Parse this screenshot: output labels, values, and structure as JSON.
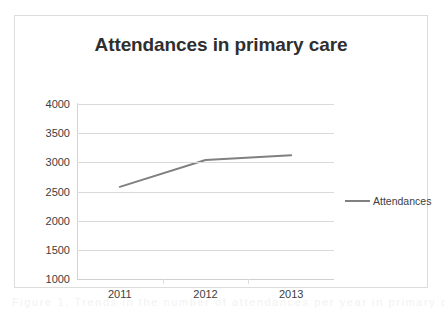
{
  "figure": {
    "background_color": "#ffffff",
    "frame_color": "#dcdcdc"
  },
  "caption": {
    "text": "Figure 1. Trends in the number of attendances per year in primary care"
  },
  "chart_data": {
    "type": "line",
    "title": "Attendances in primary care",
    "subtitle": "",
    "xlabel": "",
    "ylabel": "",
    "categories": [
      "2011",
      "2012",
      "2013"
    ],
    "x": [
      2011,
      2012,
      2013
    ],
    "series": [
      {
        "name": "Attendances",
        "color": "#808080",
        "values": [
          2580,
          3040,
          3120
        ]
      }
    ],
    "ylim": [
      1000,
      4000
    ],
    "yticks": [
      1000,
      1500,
      2000,
      2500,
      3000,
      3500,
      4000
    ],
    "ytick_labels": [
      "1000",
      "1500",
      "2000",
      "2500",
      "3000",
      "3500",
      "4000"
    ],
    "xtick_labels": [
      "2011",
      "2012",
      "2013"
    ],
    "grid": true,
    "grid_axis": "y",
    "grid_color": "#d9d9d9",
    "legend": true,
    "legend_position": "right",
    "legend_entries": [
      "Attendances"
    ],
    "markers": false
  }
}
